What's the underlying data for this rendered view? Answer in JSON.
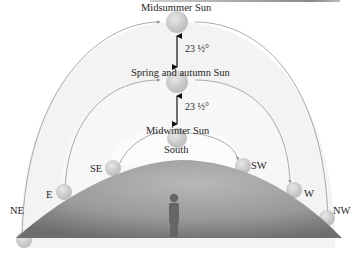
{
  "diagram": {
    "sun_positions": [
      {
        "id": "midsummer",
        "label": "Midsummer Sun"
      },
      {
        "id": "equinox",
        "label": "Spring and autumn Sun"
      },
      {
        "id": "midwinter",
        "label": "Midwinter Sun"
      }
    ],
    "angle_labels": [
      {
        "between": [
          "midsummer",
          "equinox"
        ],
        "text": "23 ½°"
      },
      {
        "between": [
          "equinox",
          "midwinter"
        ],
        "text": "23 ½°"
      }
    ],
    "compass_points": {
      "ne": "NE",
      "e": "E",
      "se": "SE",
      "south": "South",
      "sw": "SW",
      "w": "W",
      "nw": "NW"
    },
    "paths": [
      {
        "season": "midsummer",
        "rises": "NE",
        "sets": "NW"
      },
      {
        "season": "equinox",
        "rises": "E",
        "sets": "W"
      },
      {
        "season": "midwinter",
        "rises": "SE",
        "sets": "SW"
      }
    ],
    "observer": "person standing on the ground",
    "colors": {
      "sky_band": "#f2f2f2",
      "arc_line": "#9a9a9a",
      "ground_light": "#bdbdbd",
      "ground_dark": "#7a7a7a",
      "sun_fill": "#d0d0d0",
      "arrow": "#111111",
      "person": "#6a6a6a"
    }
  }
}
